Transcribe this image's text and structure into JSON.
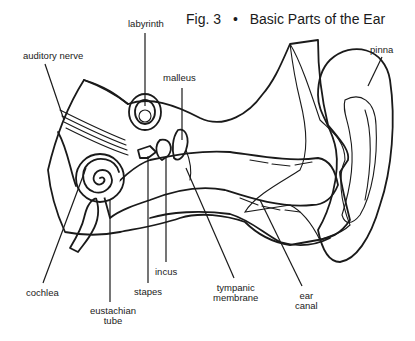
{
  "figure": {
    "number": "Fig. 3",
    "separator": "•",
    "title": "Basic Parts of the Ear"
  },
  "labels": {
    "labyrinth": "labyrinth",
    "auditory_nerve": "auditory nerve",
    "malleus": "malleus",
    "pinna": "pinna",
    "cochlea": "cochlea",
    "eustachian_tube_line1": "eustachian",
    "eustachian_tube_line2": "tube",
    "stapes": "stapes",
    "incus": "incus",
    "tympanic_membrane_line1": "tympanic",
    "tympanic_membrane_line2": "membrane",
    "ear_canal_line1": "ear",
    "ear_canal_line2": "canal"
  },
  "colors": {
    "ink": "#1a1a1a",
    "paper": "#ffffff"
  }
}
